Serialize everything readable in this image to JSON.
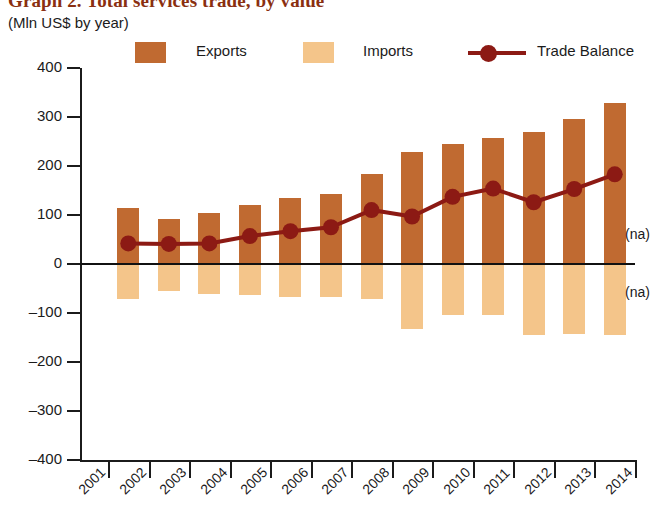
{
  "title": {
    "main": "Graph 2. Total services trade, by value",
    "subtitle": "(Mln US$ by year)"
  },
  "legend": {
    "position": "top",
    "items": [
      {
        "label": "Exports",
        "color": "#C06A31",
        "marker": "square"
      },
      {
        "label": "Imports",
        "color": "#F4C58A",
        "marker": "square"
      },
      {
        "label": "Trade Balance",
        "color": "#8C1A14",
        "marker": "line-dot"
      }
    ]
  },
  "annotations": [
    {
      "text": "(na)",
      "x": 2014,
      "y": 60
    },
    {
      "text": "(na)",
      "x": 2014,
      "y": -60
    }
  ],
  "chart_data": {
    "type": "bar",
    "title": "Graph 2. Total services trade, by value",
    "subtitle": "(Mln US$ by year)",
    "xlabel": "",
    "ylabel": "",
    "ylim": [
      -400,
      400
    ],
    "yticks": [
      400,
      300,
      200,
      100,
      0,
      -100,
      -200,
      -300,
      -400
    ],
    "ytick_labels": [
      "400",
      "300",
      "200",
      "100",
      "0",
      "-100",
      "-200",
      "-300",
      "-400"
    ],
    "xticks": [
      2001,
      2002,
      2003,
      2004,
      2005,
      2006,
      2007,
      2008,
      2009,
      2010,
      2011,
      2012,
      2013,
      2014
    ],
    "xtick_labels": [
      "2001",
      "2002",
      "2003",
      "2004",
      "2005",
      "2006",
      "2007",
      "2008",
      "2009",
      "2010",
      "2011",
      "2012",
      "2013",
      "2014"
    ],
    "categories": [
      "2001",
      "2002",
      "2003",
      "2004",
      "2005",
      "2006",
      "2007",
      "2008",
      "2009",
      "2010",
      "2011",
      "2012",
      "2013"
    ],
    "grid": false,
    "legend_position": "top",
    "series": [
      {
        "name": "Exports",
        "type": "bar",
        "color": "#C06A31",
        "values": [
          115,
          92,
          105,
          120,
          135,
          143,
          183,
          228,
          245,
          257,
          270,
          295,
          328
        ]
      },
      {
        "name": "Imports",
        "type": "bar",
        "color": "#F4C58A",
        "values": [
          -72,
          -55,
          -62,
          -64,
          -68,
          -68,
          -72,
          -133,
          -105,
          -105,
          -145,
          -143,
          -145
        ]
      },
      {
        "name": "Trade Balance",
        "type": "line",
        "color": "#8C1A14",
        "values": [
          42,
          41,
          42,
          57,
          67,
          75,
          110,
          97,
          137,
          154,
          126,
          153,
          183
        ]
      }
    ]
  }
}
